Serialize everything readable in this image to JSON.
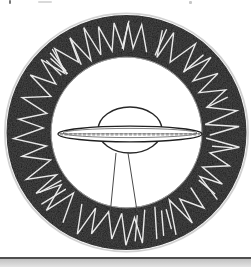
{
  "meta": {
    "width": 251,
    "height": 267,
    "background": "#ffffff",
    "kind": "scanned black-and-white book illustration"
  },
  "illustration": {
    "name": "ufo-rune-ring-emblem",
    "description": "Hand-drawn circular emblem: a thick black ring filled with white zig-zag rune-like marks, enclosing a line drawing of a flying saucer with a domed top and a tapered beam projecting downward to the ring.",
    "colors": {
      "paper": "#ffffff",
      "ring_black": "#161616",
      "rune_white": "#e9e9e9",
      "ink": "#272727",
      "outer_halo": "#b9b9b9",
      "inner_edge": "#c2c2c2",
      "rule_dark": "#4f4f4f",
      "rule_shade": "#c6c6c6"
    },
    "geometry": {
      "cx": 126.5,
      "cy": 132.5,
      "outer_rx": 120,
      "outer_ry": 117.5,
      "inner_r": 75
    },
    "zigzag": {
      "seed": 11,
      "r_inner": 79,
      "r_outer": 114,
      "jitter_inner": 7,
      "jitter_outer": 7,
      "step_min": 2.6,
      "step_var": 4.8,
      "break_chance": 0.12,
      "extra_marks": 16,
      "stroke_width": 1.4
    },
    "ufo": {
      "dome": {
        "cx": 130,
        "cy": 130,
        "rx": 32,
        "ry": 23
      },
      "disk": {
        "cx": 130,
        "cy": 134,
        "rx": 72,
        "ry": 7.8
      },
      "disk_inner": {
        "cx": 130,
        "cy": 133,
        "rx": 67,
        "ry": 4.6
      },
      "band_y": 134.4,
      "band_x1": 60,
      "band_x2": 200,
      "beam": {
        "left": [
          116,
          153,
          110.5,
          210
        ],
        "right": [
          128,
          153,
          137,
          211
        ]
      }
    },
    "artifacts": {
      "top_ticks": [
        {
          "x": 9,
          "y": 0,
          "w": 2,
          "h": 4,
          "color": "#555555",
          "opacity": 0.8
        },
        {
          "x": 38,
          "y": 1,
          "w": 14,
          "h": 2,
          "color": "#aaaaaa",
          "opacity": 0.45
        },
        {
          "x": 189,
          "y": 1,
          "w": 3,
          "h": 3,
          "color": "#999999",
          "opacity": 0.55
        }
      ],
      "bottom_rule_y": 257,
      "bottom_rule_h": 2,
      "bottom_strip_h": 8
    }
  }
}
